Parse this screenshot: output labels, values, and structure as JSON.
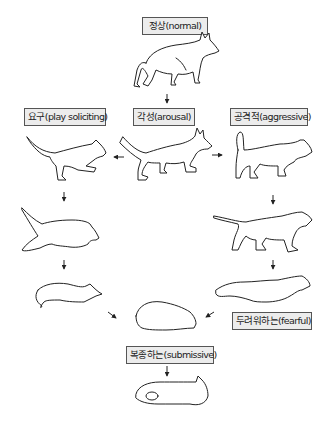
{
  "states": {
    "normal": "정상(normal)",
    "arousal": "각성(arousal)",
    "play": "요구(play soliciting)",
    "aggressive": "공격적(aggressive)",
    "fearful": "두려워하는(fearful)",
    "submissive": "복종하는(submissive)"
  },
  "transitions": [
    {
      "from": "normal",
      "to": "arousal"
    },
    {
      "from": "arousal",
      "to": "play"
    },
    {
      "from": "arousal",
      "to": "aggressive"
    },
    {
      "from": "play",
      "to": "play-stage-2"
    },
    {
      "from": "play-stage-2",
      "to": "play-bow"
    },
    {
      "from": "play-bow",
      "to": "submissive"
    },
    {
      "from": "aggressive",
      "to": "aggressive-stage-2"
    },
    {
      "from": "aggressive-stage-2",
      "to": "fearful"
    },
    {
      "from": "fearful",
      "to": "submissive"
    },
    {
      "from": "submissive",
      "to": "submissive-lying"
    }
  ],
  "colors": {
    "label_bg": "#ececec",
    "label_border": "#555555",
    "line": "#222222"
  }
}
